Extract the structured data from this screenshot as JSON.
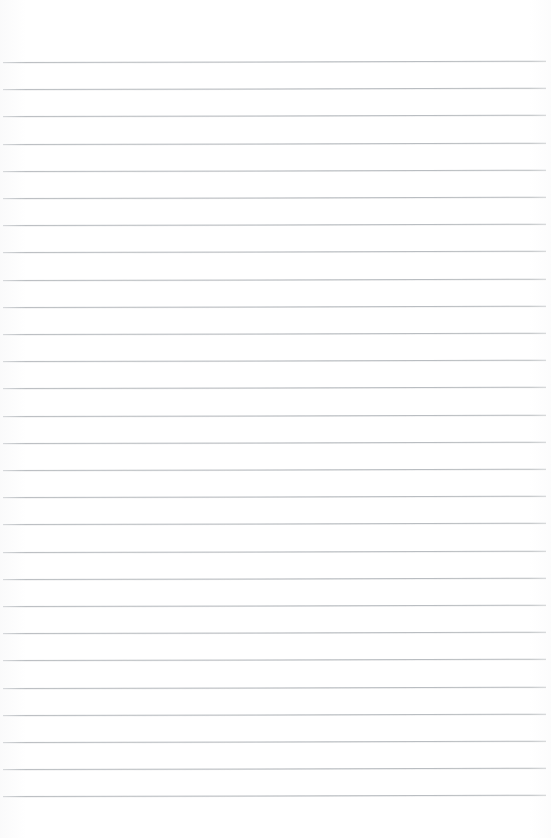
{
  "document": {
    "type": "ruled-notebook-page",
    "title": "Blank ruled page",
    "page_width": 551,
    "page_height": 838,
    "background_color": "#ffffff",
    "content_text": "",
    "is_blank": true
  },
  "ruling": {
    "line_color": "#b6babe",
    "line_thickness": 1,
    "line_count": 28,
    "line_spacing": 27.2,
    "first_line_y": 62,
    "last_line_y": 810,
    "line_start_x": 3,
    "line_end_x": 546,
    "skew_degrees": -0.13
  },
  "margins": {
    "top": 62,
    "bottom": 28,
    "left": 3,
    "right": 5
  }
}
